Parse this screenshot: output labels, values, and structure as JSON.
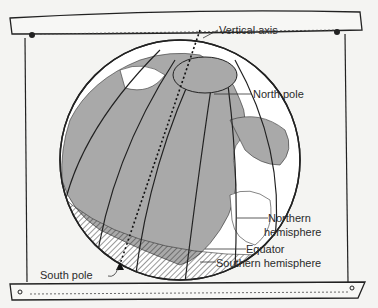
{
  "diagram": {
    "labels": {
      "vertical_axis": "Vertical axis",
      "north_pole": "North pole",
      "northern_hemisphere_line1": "Northern",
      "northern_hemisphere_line2": "hemisphere",
      "equator": "Equator",
      "southern_hemisphere": "Southern hemisphere",
      "south_pole": "South pole"
    },
    "colors": {
      "background": "#f4f4f2",
      "land": "#a9a9a9",
      "ocean": "#ffffff",
      "ink": "#222222"
    }
  }
}
